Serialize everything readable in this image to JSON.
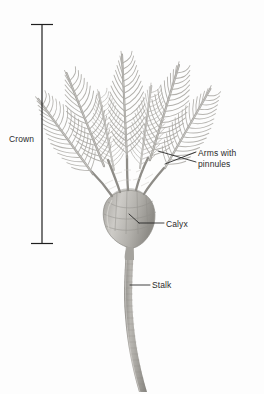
{
  "figure": {
    "background_color": "#fdfdfd",
    "width": 264,
    "height": 394
  },
  "labels": {
    "crown": "Crown",
    "arms_line1": "Arms with",
    "arms_line2": "pinnules",
    "calyx": "Calyx",
    "stalk": "Stalk"
  },
  "bracket": {
    "name": "crown-extent-bracket",
    "top_y": 24,
    "bottom_y": 244,
    "x": 42,
    "cap_half_width": 11,
    "color": "#1f1f1f"
  },
  "leaders": [
    {
      "name": "arms-leader-upper",
      "from": [
        196,
        151
      ],
      "to": [
        163,
        163
      ],
      "color": "#1f1f1f"
    },
    {
      "name": "arms-leader-lower",
      "from": [
        196,
        161
      ],
      "to": [
        160,
        150
      ],
      "color": "#1f1f1f"
    },
    {
      "name": "calyx-leader",
      "from": [
        164,
        223
      ],
      "to": [
        137,
        223
      ],
      "color": "#1f1f1f"
    },
    {
      "name": "calyx-leader-hook",
      "from": [
        137,
        223
      ],
      "to": [
        128,
        215
      ],
      "color": "#1f1f1f"
    },
    {
      "name": "stalk-leader",
      "from": [
        150,
        285
      ],
      "to": [
        131,
        285
      ],
      "color": "#1f1f1f"
    }
  ],
  "organism": {
    "name": "crinoid",
    "common_name": "sea lily",
    "parts": {
      "crown": {
        "description": "feathery arms and calyx above the stalk"
      },
      "arms": {
        "count_visible": 6,
        "description": "branching arms bearing lateral pinnules"
      },
      "calyx": {
        "description": "cup-shaped body at base of arms"
      },
      "stalk": {
        "description": "segmented columnal stalk curving downward"
      }
    },
    "colors": {
      "arm_stroke": "#8e8d8b",
      "pinnule_stroke": "#a3a2a0",
      "calyx_fill": "#b4b2af",
      "calyx_shade": "#96948f",
      "stalk_fill": "#a9a7a3",
      "stalk_shade": "#8b8984",
      "highlight": "#d8d6d2"
    }
  }
}
